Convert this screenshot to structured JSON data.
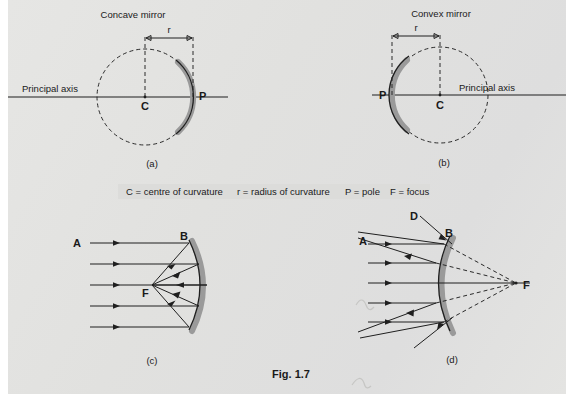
{
  "figure": {
    "caption": "Fig. 1.7",
    "legend": {
      "items": [
        "C = centre of curvature",
        "r = radius of curvature",
        "P = pole",
        "F = focus"
      ]
    },
    "panels": [
      {
        "id": "a",
        "sublabel": "(a)",
        "title": "Concave mirror",
        "axis_label": "Principal axis",
        "labels": {
          "center": "C",
          "pole": "P",
          "radius": "r"
        }
      },
      {
        "id": "b",
        "sublabel": "(b)",
        "title": "Convex mirror",
        "axis_label": "Principal axis",
        "labels": {
          "center": "C",
          "pole": "P",
          "radius": "r"
        }
      },
      {
        "id": "c",
        "sublabel": "(c)",
        "title": "",
        "labels": {
          "incident": "A",
          "mirror_top": "B",
          "focus": "F"
        }
      },
      {
        "id": "d",
        "sublabel": "(d)",
        "title": "",
        "labels": {
          "incident": "A",
          "incident2": "D",
          "mirror_top": "B",
          "focus": "F"
        }
      }
    ]
  },
  "colors": {
    "paper": "#e3e3e1",
    "ink": "#1f1f1f",
    "mirror_gray": "#9a9a9a",
    "legend_bg": "#dcdcda"
  }
}
